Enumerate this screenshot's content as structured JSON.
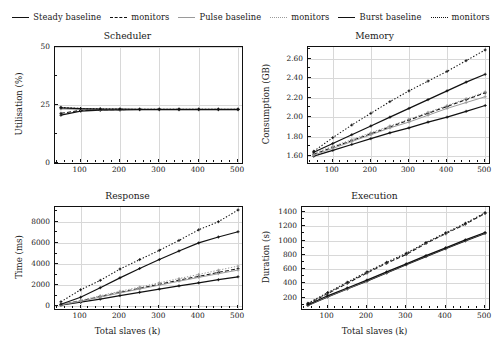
{
  "figure": {
    "legend": [
      {
        "label": "Steady baseline",
        "style": "solid",
        "name": "legend-steady-baseline"
      },
      {
        "label": "monitors",
        "style": "dashed",
        "name": "legend-steady-monitors"
      },
      {
        "label": "Pulse baseline",
        "style": "solid-light",
        "name": "legend-pulse-baseline"
      },
      {
        "label": "monitors",
        "style": "dotted-light",
        "name": "legend-pulse-monitors"
      },
      {
        "label": "Burst baseline",
        "style": "solid",
        "name": "legend-burst-baseline"
      },
      {
        "label": "monitors",
        "style": "dotted",
        "name": "legend-burst-monitors"
      }
    ]
  },
  "chart_data": [
    {
      "type": "line",
      "title": "Scheduler",
      "xlabel": "",
      "ylabel": "Utilisation (%)",
      "xlim": [
        35,
        510
      ],
      "ylim": [
        0,
        50
      ],
      "xticks": [
        100,
        200,
        300,
        400,
        500
      ],
      "xticklabels": [
        "100",
        "200",
        "300",
        "400",
        "500"
      ],
      "yticks": [
        0,
        25,
        50
      ],
      "yticklabels": [
        "0",
        "25",
        "50"
      ],
      "grid": true,
      "x": [
        50,
        100,
        150,
        200,
        250,
        300,
        350,
        400,
        450,
        500
      ],
      "series": [
        {
          "name": "Steady baseline",
          "style": "solid",
          "values": [
            20.6,
            22.4,
            22.8,
            22.9,
            23.0,
            23.0,
            23.0,
            23.0,
            23.0,
            23.0
          ]
        },
        {
          "name": "Steady monitors",
          "style": "dashed",
          "values": [
            21.4,
            22.7,
            22.9,
            23.0,
            23.1,
            23.1,
            23.1,
            23.1,
            23.1,
            23.1
          ]
        },
        {
          "name": "Pulse baseline",
          "style": "solid-light",
          "values": [
            23.3,
            23.1,
            23.0,
            23.0,
            23.0,
            23.0,
            23.0,
            23.0,
            23.0,
            23.0
          ]
        },
        {
          "name": "Pulse monitors",
          "style": "dotted-light",
          "values": [
            23.6,
            23.3,
            23.2,
            23.1,
            23.1,
            23.1,
            23.1,
            23.1,
            23.1,
            23.1
          ]
        },
        {
          "name": "Burst baseline",
          "style": "solid",
          "values": [
            23.8,
            23.4,
            23.2,
            23.2,
            23.1,
            23.1,
            23.1,
            23.1,
            23.1,
            23.1
          ]
        },
        {
          "name": "Burst monitors",
          "style": "dotted",
          "values": [
            24.0,
            23.5,
            23.3,
            23.2,
            23.2,
            23.2,
            23.2,
            23.2,
            23.2,
            23.2
          ]
        }
      ]
    },
    {
      "type": "line",
      "title": "Memory",
      "xlabel": "",
      "ylabel": "Consumption (GB)",
      "xlim": [
        35,
        510
      ],
      "ylim": [
        1.53,
        2.72
      ],
      "xticks": [
        100,
        200,
        300,
        400,
        500
      ],
      "xticklabels": [
        "100",
        "200",
        "300",
        "400",
        "500"
      ],
      "yticks": [
        1.6,
        1.8,
        2.0,
        2.2,
        2.4,
        2.6
      ],
      "yticklabels": [
        "1.60",
        "1.80",
        "2.00",
        "2.20",
        "2.40",
        "2.60"
      ],
      "grid": true,
      "x": [
        50,
        100,
        150,
        200,
        250,
        300,
        350,
        400,
        450,
        500
      ],
      "series": [
        {
          "name": "Steady baseline",
          "style": "solid",
          "values": [
            1.6,
            1.66,
            1.72,
            1.78,
            1.84,
            1.89,
            1.95,
            2.0,
            2.06,
            2.12
          ]
        },
        {
          "name": "Steady monitors",
          "style": "dashed",
          "values": [
            1.62,
            1.69,
            1.76,
            1.83,
            1.9,
            1.97,
            2.04,
            2.11,
            2.18,
            2.25
          ]
        },
        {
          "name": "Pulse baseline",
          "style": "solid-light",
          "values": [
            1.61,
            1.68,
            1.75,
            1.82,
            1.89,
            1.95,
            2.02,
            2.09,
            2.15,
            2.21
          ]
        },
        {
          "name": "Pulse monitors",
          "style": "dotted-light",
          "values": [
            1.63,
            1.7,
            1.77,
            1.84,
            1.91,
            1.98,
            2.05,
            2.12,
            2.19,
            2.26
          ]
        },
        {
          "name": "Burst baseline",
          "style": "solid",
          "values": [
            1.64,
            1.73,
            1.82,
            1.91,
            2.0,
            2.09,
            2.18,
            2.27,
            2.36,
            2.44
          ]
        },
        {
          "name": "Burst monitors",
          "style": "dotted",
          "values": [
            1.65,
            1.79,
            1.92,
            2.04,
            2.16,
            2.27,
            2.37,
            2.47,
            2.58,
            2.69
          ]
        }
      ]
    },
    {
      "type": "line",
      "title": "Response",
      "xlabel": "Total slaves (k)",
      "ylabel": "Time (ms)",
      "xlim": [
        35,
        510
      ],
      "ylim": [
        -250,
        9400
      ],
      "xticks": [
        100,
        200,
        300,
        400,
        500
      ],
      "xticklabels": [
        "100",
        "200",
        "300",
        "400",
        "500"
      ],
      "yticks": [
        0,
        2000,
        4000,
        6000,
        8000
      ],
      "yticklabels": [
        "0",
        "2000",
        "4000",
        "6000",
        "8000"
      ],
      "grid": true,
      "x": [
        50,
        100,
        150,
        200,
        250,
        300,
        350,
        400,
        450,
        500
      ],
      "series": [
        {
          "name": "Steady baseline",
          "style": "solid",
          "values": [
            120,
            390,
            690,
            1020,
            1330,
            1640,
            1940,
            2230,
            2520,
            2800
          ]
        },
        {
          "name": "Steady monitors",
          "style": "dashed",
          "values": [
            150,
            520,
            920,
            1330,
            1700,
            2080,
            2470,
            2840,
            3210,
            3570
          ]
        },
        {
          "name": "Pulse baseline",
          "style": "solid-light",
          "values": [
            140,
            480,
            870,
            1270,
            1640,
            2010,
            2380,
            2740,
            3090,
            3430
          ]
        },
        {
          "name": "Pulse monitors",
          "style": "dotted-light",
          "values": [
            170,
            560,
            1000,
            1430,
            1820,
            2230,
            2630,
            3020,
            3420,
            3810
          ]
        },
        {
          "name": "Burst baseline",
          "style": "solid",
          "values": [
            200,
            860,
            1760,
            2700,
            3580,
            4430,
            5240,
            6000,
            6560,
            7060
          ]
        },
        {
          "name": "Burst monitors",
          "style": "dotted",
          "values": [
            430,
            1570,
            2460,
            3530,
            4420,
            5300,
            6240,
            7240,
            8010,
            9120
          ]
        }
      ]
    },
    {
      "type": "line",
      "title": "Execution",
      "xlabel": "Total slaves (k)",
      "ylabel": "Duration (s)",
      "xlim": [
        35,
        510
      ],
      "ylim": [
        40,
        1470
      ],
      "xticks": [
        100,
        200,
        300,
        400,
        500
      ],
      "xticklabels": [
        "100",
        "200",
        "300",
        "400",
        "500"
      ],
      "yticks": [
        200,
        400,
        600,
        800,
        1000,
        1200,
        1400
      ],
      "yticklabels": [
        "200",
        "400",
        "600",
        "800",
        "1000",
        "1200",
        "1400"
      ],
      "grid": true,
      "x": [
        50,
        100,
        150,
        200,
        250,
        300,
        350,
        400,
        450,
        500
      ],
      "series": [
        {
          "name": "Steady baseline",
          "style": "solid",
          "values": [
            90,
            210,
            320,
            430,
            545,
            660,
            775,
            885,
            995,
            1100
          ]
        },
        {
          "name": "Steady monitors",
          "style": "dashed",
          "values": [
            110,
            255,
            400,
            545,
            680,
            805,
            960,
            1095,
            1230,
            1380
          ]
        },
        {
          "name": "Pulse baseline",
          "style": "solid-light",
          "values": [
            95,
            215,
            325,
            437,
            552,
            668,
            782,
            893,
            1003,
            1108
          ]
        },
        {
          "name": "Pulse monitors",
          "style": "dotted-light",
          "values": [
            115,
            262,
            408,
            552,
            688,
            815,
            968,
            1102,
            1238,
            1385
          ]
        },
        {
          "name": "Burst baseline",
          "style": "solid",
          "values": [
            100,
            225,
            335,
            445,
            560,
            672,
            788,
            898,
            1008,
            1112
          ]
        },
        {
          "name": "Burst monitors",
          "style": "dotted",
          "values": [
            120,
            270,
            415,
            560,
            695,
            822,
            972,
            1108,
            1242,
            1390
          ]
        }
      ]
    }
  ]
}
